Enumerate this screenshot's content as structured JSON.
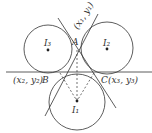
{
  "diagram": {
    "labels": {
      "A": "A",
      "A_coord": "(x₁, y₁)",
      "B": "B",
      "B_coord": "(x₂, y₂)",
      "C": "C",
      "C_coord": "(x₃, y₃)",
      "I1": "I₁",
      "I2": "I₂",
      "I3": "I₃"
    },
    "stroke_color": "#333333"
  }
}
